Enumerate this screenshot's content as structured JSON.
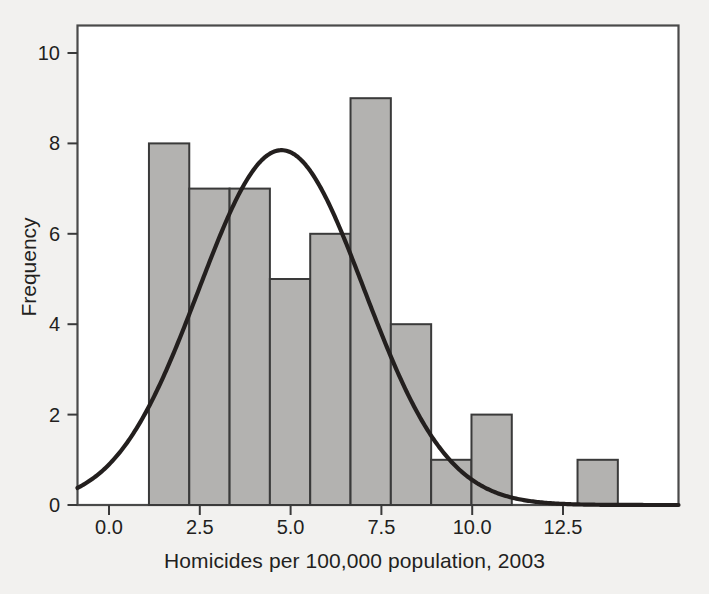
{
  "chart_data": {
    "type": "bar",
    "title": "",
    "subtitle": "",
    "xlabel": "Homicides per 100,000 population, 2003",
    "ylabel": "Frequency",
    "xlim": [
      -0.88,
      15.7
    ],
    "ylim": [
      0,
      10.6
    ],
    "xticks": [
      0.0,
      2.5,
      5.0,
      7.5,
      10.0,
      12.5
    ],
    "xtick_labels": [
      "0.0",
      "2.5",
      "5.0",
      "7.5",
      "10.0",
      "12.5"
    ],
    "yticks": [
      0,
      2,
      4,
      6,
      8,
      10
    ],
    "ytick_labels": [
      "0",
      "2",
      "4",
      "6",
      "8",
      "10"
    ],
    "grid": false,
    "legend": "none",
    "bin_width": 1.11,
    "bin_starts": [
      1.1,
      2.21,
      3.32,
      4.43,
      5.54,
      6.65,
      7.76,
      8.87,
      9.98,
      12.9
    ],
    "categories": [
      "1.1-2.2",
      "2.2-3.3",
      "3.3-4.4",
      "4.4-5.5",
      "5.5-6.7",
      "6.7-7.8",
      "7.8-8.9",
      "8.9-10.0",
      "10.0-11.1",
      "12.9-14.0"
    ],
    "values": [
      8,
      7,
      7,
      5,
      6,
      9,
      4,
      1,
      2,
      1
    ],
    "bar_fill": "#b3b2b0",
    "bar_stroke": "#3a3a3a",
    "overlay": {
      "name": "normal curve",
      "type": "line",
      "color": "#231f1e",
      "mean": 4.75,
      "sigma": 2.28,
      "peak_value": 7.85,
      "left_edge_value": 0.8,
      "right_edge_value": 0.08
    }
  },
  "axis": {
    "xlabel": "Homicides per 100,000 population, 2003",
    "ylabel": "Frequency"
  }
}
